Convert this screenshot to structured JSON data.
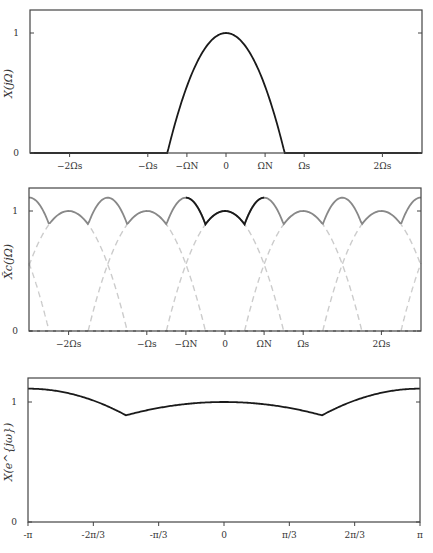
{
  "chart_data": [
    {
      "type": "line",
      "title": "",
      "ylabel": "X(jΩ)",
      "xlabel": "",
      "xticks": [
        {
          "label": "−2Ωs",
          "value": -2
        },
        {
          "label": "−Ωs",
          "value": -1
        },
        {
          "label": "−ΩN",
          "value": -0.5
        },
        {
          "label": "0",
          "value": 0
        },
        {
          "label": "ΩN",
          "value": 0.5
        },
        {
          "label": "Ωs",
          "value": 1
        },
        {
          "label": "2Ωs",
          "value": 2
        }
      ],
      "yticks": [
        {
          "label": "0",
          "value": 0
        },
        {
          "label": "1",
          "value": 1
        }
      ],
      "xlim": [
        -2.5,
        2.5
      ],
      "ylim": [
        0,
        1.2
      ],
      "x_unit": "Ωs",
      "series": [
        {
          "name": "X(jΩ)",
          "color": "#1a1a1a",
          "style": "solid",
          "description": "parabolic lowpass spectrum 1-(Ω/0.75Ωs)^2, zero for |Ω|>0.75Ωs",
          "x": [
            -2.5,
            -0.75,
            -0.5,
            -0.25,
            0,
            0.25,
            0.5,
            0.75,
            2.5
          ],
          "y": [
            0,
            0,
            0.556,
            0.889,
            1.0,
            0.889,
            0.556,
            0,
            0
          ]
        }
      ],
      "grid": false
    },
    {
      "type": "line",
      "title": "",
      "ylabel": "X̃c(jΩ)",
      "xlabel": "",
      "xticks": [
        {
          "label": "−2Ωs",
          "value": -2
        },
        {
          "label": "−Ωs",
          "value": -1
        },
        {
          "label": "−ΩN",
          "value": -0.5
        },
        {
          "label": "0",
          "value": 0
        },
        {
          "label": "ΩN",
          "value": 0.5
        },
        {
          "label": "Ωs",
          "value": 1
        },
        {
          "label": "2Ωs",
          "value": 2
        }
      ],
      "yticks": [
        {
          "label": "0",
          "value": 0
        },
        {
          "label": "1",
          "value": 1
        }
      ],
      "xlim": [
        -2.5,
        2.5
      ],
      "ylim": [
        0,
        1.2
      ],
      "x_unit": "Ωs",
      "series": [
        {
          "name": "replicas X(j(Ω−kΩs))",
          "color": "#cccccc",
          "style": "dashed",
          "centers": [
            -3,
            -2,
            -1,
            0,
            1,
            2,
            3
          ]
        },
        {
          "name": "aliased sum",
          "color": "#888888",
          "style": "solid",
          "x": [
            -2.5,
            -2.25,
            -2,
            -1.5,
            -1.25,
            -1,
            -0.5,
            -0.25,
            0,
            0.25,
            0.5,
            1,
            1.25,
            1.5,
            2,
            2.25,
            2.5
          ],
          "y": [
            1.111,
            0.889,
            1.0,
            1.111,
            0.889,
            1.0,
            1.111,
            0.889,
            1.0,
            0.889,
            1.111,
            1.0,
            0.889,
            1.111,
            1.0,
            0.889,
            1.111
          ]
        },
        {
          "name": "aliased sum, baseband [−ΩN, ΩN]",
          "color": "#1a1a1a",
          "style": "solid",
          "x": [
            -0.5,
            -0.25,
            0,
            0.25,
            0.5
          ],
          "y": [
            1.111,
            0.889,
            1.0,
            0.889,
            1.111
          ]
        }
      ],
      "grid": false
    },
    {
      "type": "line",
      "title": "",
      "ylabel": "X(e^{jω})",
      "xlabel": "",
      "xticks": [
        {
          "label": "-π",
          "value": -3.1416
        },
        {
          "label": "-2π/3",
          "value": -2.0944
        },
        {
          "label": "-π/3",
          "value": -1.0472
        },
        {
          "label": "0",
          "value": 0
        },
        {
          "label": "π/3",
          "value": 1.0472
        },
        {
          "label": "2π/3",
          "value": 2.0944
        },
        {
          "label": "π",
          "value": 3.1416
        }
      ],
      "yticks": [
        {
          "label": "0",
          "value": 0
        },
        {
          "label": "1",
          "value": 1
        }
      ],
      "xlim": [
        -3.1416,
        3.1416
      ],
      "ylim": [
        0,
        1.2
      ],
      "series": [
        {
          "name": "X(e^{jω})",
          "color": "#1a1a1a",
          "style": "solid",
          "x": [
            -3.1416,
            -2.3562,
            -1.5708,
            -0.7854,
            0,
            0.7854,
            1.5708,
            2.3562,
            3.1416
          ],
          "y": [
            1.111,
            1.028,
            0.889,
            0.972,
            1.0,
            0.972,
            0.889,
            1.028,
            1.111
          ]
        }
      ],
      "grid": false
    }
  ],
  "model": {
    "half_width_in_Ωs": 0.75
  }
}
